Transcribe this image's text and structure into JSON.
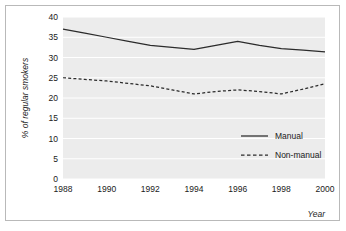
{
  "chart_data": {
    "type": "line",
    "title": "",
    "xlabel": "Year",
    "ylabel": "% of regular smokers",
    "x": [
      1988,
      1989,
      1990,
      1991,
      1992,
      1993,
      1994,
      1995,
      1996,
      1997,
      1998,
      1999,
      2000
    ],
    "xticks": [
      "1988",
      "1990",
      "1992",
      "1994",
      "1996",
      "1998",
      "2000"
    ],
    "xtick_values": [
      1988,
      1990,
      1992,
      1994,
      1996,
      1998,
      2000
    ],
    "yticks": [
      "0",
      "5",
      "10",
      "15",
      "20",
      "25",
      "30",
      "35",
      "40"
    ],
    "ytick_values": [
      0,
      5,
      10,
      15,
      20,
      25,
      30,
      35,
      40
    ],
    "xlim": [
      1988,
      2000
    ],
    "ylim": [
      0,
      40
    ],
    "grid": "horizontal-white",
    "plot_background": "#ececec",
    "legend_position": "inside-lower-right",
    "series": [
      {
        "name": "Manual",
        "style": "solid",
        "color": "#2b2b2b",
        "values": [
          37.0,
          36.0,
          35.0,
          34.0,
          33.0,
          32.5,
          32.0,
          33.0,
          34.0,
          33.0,
          32.2,
          31.8,
          31.4
        ]
      },
      {
        "name": "Non-manual",
        "style": "dashed",
        "color": "#2b2b2b",
        "values": [
          25.0,
          24.6,
          24.2,
          23.6,
          23.0,
          22.0,
          21.0,
          21.6,
          22.0,
          21.6,
          21.0,
          22.2,
          23.5
        ]
      }
    ]
  },
  "legend": {
    "items": [
      {
        "label": "Manual",
        "style": "solid"
      },
      {
        "label": "Non-manual",
        "style": "dashed"
      }
    ]
  },
  "axes": {
    "y_title": "% of regular smokers",
    "x_title": "Year"
  }
}
